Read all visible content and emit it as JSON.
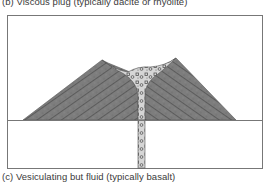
{
  "figure": {
    "caption_top": "(b) Viscous plug (typically dacite or rhyolite)",
    "caption_bottom": "(c) Vesiculating but fluid (typically basalt)",
    "colors": {
      "frame": "#777777",
      "cone_fill": "#7a7a7a",
      "cone_strata": "#4a4a4a",
      "plug_fill": "#d4d4d4",
      "plug_clasts": "#555555",
      "background": "#ffffff"
    },
    "elements": [
      "frame",
      "ground-line",
      "volcanic-cone",
      "viscous-plug",
      "conduit"
    ]
  }
}
